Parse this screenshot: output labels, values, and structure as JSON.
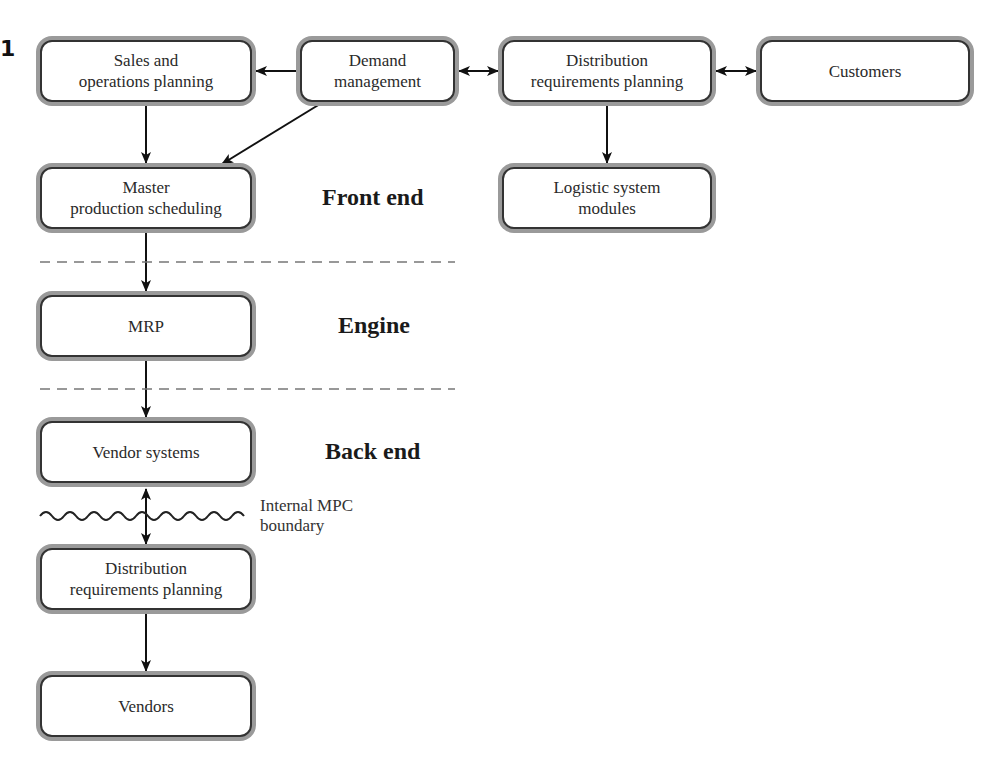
{
  "figure": {
    "number": "1"
  },
  "nodes": {
    "sop": {
      "line1": "Sales and",
      "line2": "operations planning"
    },
    "demand": {
      "line1": "Demand",
      "line2": "management"
    },
    "drp_top": {
      "line1": "Distribution",
      "line2": "requirements planning"
    },
    "customers": {
      "line1": "Customers"
    },
    "mps": {
      "line1": "Master",
      "line2": "production scheduling"
    },
    "logistic": {
      "line1": "Logistic system",
      "line2": "modules"
    },
    "mrp": {
      "line1": "MRP"
    },
    "vendor_systems": {
      "line1": "Vendor systems"
    },
    "drp_bottom": {
      "line1": "Distribution",
      "line2": "requirements planning"
    },
    "vendors": {
      "line1": "Vendors"
    }
  },
  "regions": {
    "front_end": "Front end",
    "engine": "Engine",
    "back_end": "Back end"
  },
  "boundary": {
    "line1": "Internal MPC",
    "line2": "boundary"
  },
  "edges": [
    {
      "from": "Demand management",
      "to": "Sales and operations planning",
      "type": "arrow"
    },
    {
      "from": "Demand management",
      "to": "Distribution requirements planning",
      "type": "bidirectional"
    },
    {
      "from": "Distribution requirements planning",
      "to": "Customers",
      "type": "bidirectional"
    },
    {
      "from": "Sales and operations planning",
      "to": "Master production scheduling",
      "type": "arrow"
    },
    {
      "from": "Demand management",
      "to": "Master production scheduling",
      "type": "arrow"
    },
    {
      "from": "Distribution requirements planning",
      "to": "Logistic system modules",
      "type": "arrow"
    },
    {
      "from": "Master production scheduling",
      "to": "MRP",
      "type": "arrow"
    },
    {
      "from": "MRP",
      "to": "Vendor systems",
      "type": "arrow"
    },
    {
      "from": "Vendor systems",
      "to": "Distribution requirements planning (back end)",
      "type": "bidirectional"
    },
    {
      "from": "Distribution requirements planning (back end)",
      "to": "Vendors",
      "type": "arrow"
    }
  ]
}
